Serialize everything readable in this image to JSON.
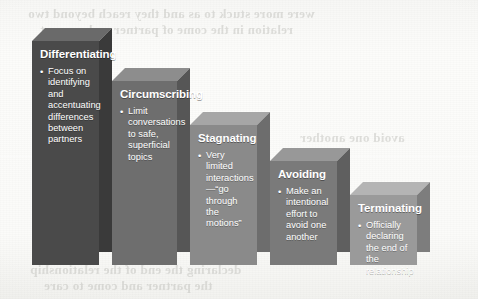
{
  "diagram": {
    "type": "descending-staircase-blocks",
    "stages": [
      {
        "id": "differentiating",
        "title": "Differentiating",
        "bullets": [
          "Focus on identifying and accentuating differences between partners"
        ],
        "front_color": "#4a4a4a",
        "top_color": "#6a6a6a",
        "side_color": "#3a3a3a",
        "x": 32,
        "y": 28,
        "width": 80,
        "height": 237
      },
      {
        "id": "circumscribing",
        "title": "Circumscribing",
        "bullets": [
          "Limit conversations to safe, superficial topics"
        ],
        "front_color": "#6e6e6e",
        "top_color": "#8d8d8d",
        "side_color": "#565656",
        "x": 112,
        "y": 68,
        "width": 78,
        "height": 197
      },
      {
        "id": "stagnating",
        "title": "Stagnating",
        "bullets": [
          "Very limited interactions—“go through the motions”"
        ],
        "front_color": "#8a8a8a",
        "top_color": "#a6a6a6",
        "side_color": "#6d6d6d",
        "x": 190,
        "y": 112,
        "width": 80,
        "height": 153
      },
      {
        "id": "avoiding",
        "title": "Avoiding",
        "bullets": [
          "Make an intentional effort to avoid one another"
        ],
        "front_color": "#7a7a7a",
        "top_color": "#989898",
        "side_color": "#5f5f5f",
        "x": 270,
        "y": 148,
        "width": 80,
        "height": 117
      },
      {
        "id": "terminating",
        "title": "Terminating",
        "bullets": [
          "Officially declaring the end of the relationship"
        ],
        "front_color": "#9a9a9a",
        "top_color": "#b4b4b4",
        "side_color": "#7d7d7d",
        "x": 350,
        "y": 182,
        "width": 80,
        "height": 83
      }
    ]
  },
  "background": {
    "bleed_through": {
      "line1": "were more stuck to as and they reach beyond two",
      "line2": "relation in the come of partner and come at",
      "line3": "declaring the end of the relationship",
      "line4": "the partner and come to care",
      "line5": "avoid one another"
    }
  }
}
